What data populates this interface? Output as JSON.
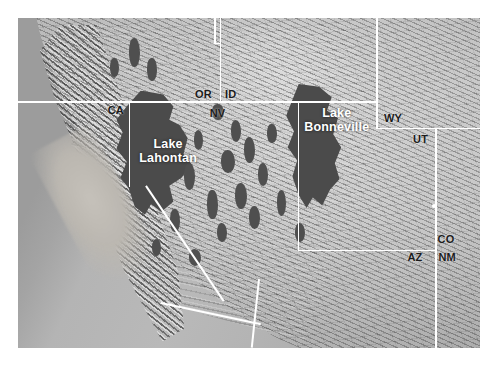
{
  "map": {
    "title": "Shaded relief map of the Great Basin showing late-Pleistocene pluvial lakes",
    "projection_note": "",
    "colors": {
      "lake_fill": "#4b4b4b",
      "boundary_line": "#ffffff",
      "label_text": "#ffffff",
      "ocean": "#9c9c9c",
      "land_light": "#d6d6d6",
      "land_shadow": "#3a3a3a",
      "page_background": "#ffffff"
    },
    "lake_labels": [
      {
        "id": "lake-lahontan",
        "line1": "Lake",
        "line2": "Lahontan"
      },
      {
        "id": "lake-bonneville",
        "line1": "Lake",
        "line2": "Bonneville"
      }
    ],
    "state_labels": [
      {
        "id": "or",
        "abbr": "OR"
      },
      {
        "id": "id",
        "abbr": "ID"
      },
      {
        "id": "ca",
        "abbr": "CA"
      },
      {
        "id": "nv",
        "abbr": "NV"
      },
      {
        "id": "wy",
        "abbr": "WY"
      },
      {
        "id": "ut",
        "abbr": "UT"
      },
      {
        "id": "co",
        "abbr": "CO"
      },
      {
        "id": "az",
        "abbr": "AZ"
      },
      {
        "id": "nm",
        "abbr": "NM"
      }
    ]
  }
}
